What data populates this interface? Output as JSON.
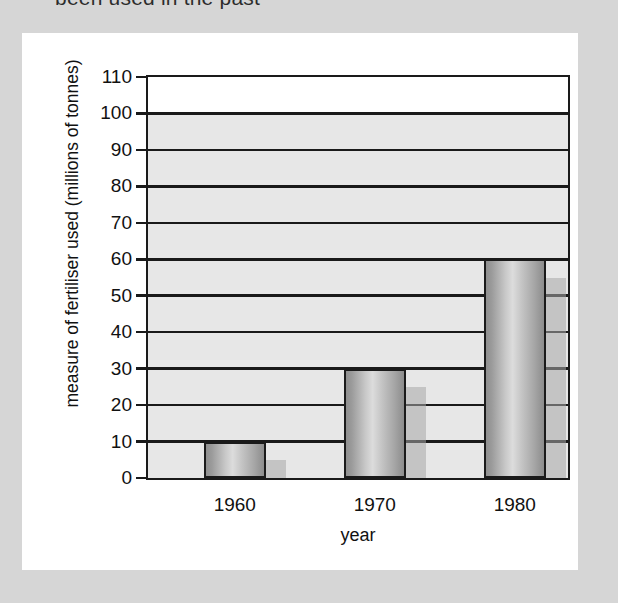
{
  "page": {
    "cut_off_caption": "been used in the past",
    "background_color": "#d6d6d6",
    "card_color": "#ffffff"
  },
  "chart_data": {
    "type": "bar",
    "title": "",
    "xlabel": "year",
    "ylabel": "measure of fertiliser used (millions of tonnes)",
    "categories": [
      "1960",
      "1970",
      "1980"
    ],
    "ylim": [
      0,
      110
    ],
    "ytick_step": 10,
    "yticks": [
      110,
      100,
      90,
      80,
      70,
      60,
      50,
      40,
      30,
      20,
      10,
      0
    ],
    "grid": true,
    "legend": "none",
    "series": [
      {
        "name": "measure of fertiliser used",
        "style": "cylinder-bar",
        "values": [
          10,
          30,
          60
        ]
      },
      {
        "name": "shadow",
        "style": "flat-shadow-bar",
        "values": [
          5,
          25,
          55
        ]
      }
    ],
    "bar_colors": {
      "main_fill_light": "#dcdcdc",
      "main_fill_dark": "#8c8c8c",
      "main_outline": "#1a1a1a",
      "shadow_fill": "#a8a8a8"
    },
    "plot_band_color": "#e7e7e7",
    "axis_color": "#1a1a1a"
  }
}
